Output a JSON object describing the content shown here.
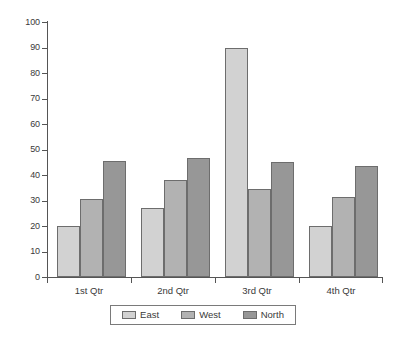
{
  "chart_data": {
    "type": "bar",
    "title": "",
    "subtitle": "",
    "xlabel": "",
    "ylabel": "",
    "categories": [
      "1st Qtr",
      "2nd Qtr",
      "3rd Qtr",
      "4th Qtr"
    ],
    "series": [
      {
        "name": "East",
        "color": "#d2d2d2",
        "values": [
          20,
          27,
          90,
          20
        ]
      },
      {
        "name": "West",
        "color": "#b2b2b2",
        "values": [
          30.5,
          38,
          34.5,
          31.5
        ]
      },
      {
        "name": "North",
        "color": "#979797",
        "values": [
          45.5,
          46.5,
          45,
          43.5
        ]
      }
    ],
    "ylim": [
      0,
      100
    ],
    "ytick_step": 10,
    "ytick_labels": [
      "100",
      "90",
      "80",
      "70",
      "60",
      "50",
      "40",
      "30",
      "20",
      "10",
      "0"
    ],
    "grid": false,
    "legend_position": "bottom",
    "legend_entries": [
      "East",
      "West",
      "North"
    ],
    "axis_color": "#555555",
    "bar_outline_color": "#6d6d6d",
    "background_color": "#ffffff"
  },
  "page": {
    "artifact_text": ""
  }
}
